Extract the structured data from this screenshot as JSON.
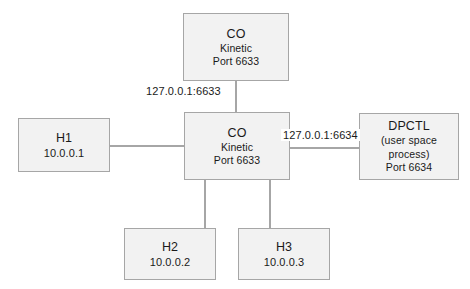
{
  "diagram": {
    "background_color": "#ffffff",
    "node_fill": "#f2f2f2",
    "node_border": "#a6a6a6",
    "edge_color": "#a6a6a6",
    "text_color": "#1a1a1a"
  },
  "nodes": {
    "co_top": {
      "title": "CO",
      "subtitle": "Kinetic",
      "port": "Port 6633"
    },
    "co_main": {
      "title": "CO",
      "subtitle": "Kinetic",
      "port": "Port 6633"
    },
    "dpctl": {
      "title": "DPCTL",
      "line2": "(user space",
      "line3": "process)",
      "port": "Port 6634"
    },
    "h1": {
      "title": "H1",
      "address": "10.0.0.1"
    },
    "h2": {
      "title": "H2",
      "address": "10.0.0.2"
    },
    "h3": {
      "title": "H3",
      "address": "10.0.0.3"
    }
  },
  "edge_labels": {
    "co_top_to_co_main": "127.0.0.1:6633",
    "co_main_to_dpctl": "127.0.0.1:6634"
  },
  "edges": [
    {
      "name": "co-top-to-co-main",
      "from": "co_top",
      "to": "co_main",
      "label": "127.0.0.1:6633"
    },
    {
      "name": "co-main-to-dpctl",
      "from": "co_main",
      "to": "dpctl",
      "label": "127.0.0.1:6634"
    },
    {
      "name": "h1-to-co-main",
      "from": "h1",
      "to": "co_main",
      "label": ""
    },
    {
      "name": "co-main-to-h2",
      "from": "co_main",
      "to": "h2",
      "label": ""
    },
    {
      "name": "co-main-to-h3",
      "from": "co_main",
      "to": "h3",
      "label": ""
    }
  ]
}
